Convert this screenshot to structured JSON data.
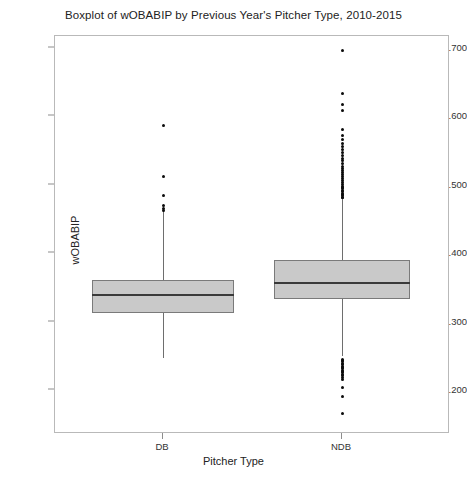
{
  "chart_data": {
    "type": "boxplot",
    "title": "Boxplot of wOBABIP by Previous Year's Pitcher Type, 2010-2015",
    "xlabel": "Pitcher Type",
    "ylabel": "wOBABIP",
    "categories": [
      "DB",
      "NDB"
    ],
    "ylim": [
      0.155,
      0.718
    ],
    "yticks": [
      0.7,
      0.6,
      0.5,
      0.4,
      0.3,
      0.2
    ],
    "ytick_labels": [
      ".700",
      ".600",
      ".500",
      ".400",
      ".300",
      ".200"
    ],
    "grid": false,
    "legend": "none",
    "box_fill_color": "#c9c9c9",
    "box_edge_color": "#7a7a7a",
    "median_color": "#3a3a3a",
    "outlier_color": "#0b0b0b",
    "boxes": [
      {
        "label": "DB",
        "whisker_low": 0.247,
        "q1": 0.313,
        "median": 0.339,
        "q3": 0.361,
        "whisker_high": 0.462,
        "outliers": [
          0.586,
          0.512,
          0.485,
          0.47,
          0.466,
          0.463
        ]
      },
      {
        "label": "NDB",
        "whisker_low": 0.25,
        "q1": 0.333,
        "median": 0.357,
        "q3": 0.39,
        "whisker_high": 0.479,
        "outliers": [
          0.697,
          0.634,
          0.618,
          0.608,
          0.581,
          0.572,
          0.566,
          0.561,
          0.556,
          0.551,
          0.547,
          0.543,
          0.539,
          0.535,
          0.531,
          0.527,
          0.524,
          0.521,
          0.518,
          0.515,
          0.512,
          0.509,
          0.506,
          0.503,
          0.5,
          0.498,
          0.496,
          0.494,
          0.492,
          0.49,
          0.488,
          0.486,
          0.484,
          0.482,
          0.481,
          0.245,
          0.243,
          0.241,
          0.239,
          0.237,
          0.235,
          0.233,
          0.231,
          0.229,
          0.227,
          0.225,
          0.223,
          0.221,
          0.219,
          0.215,
          0.204,
          0.191,
          0.166
        ]
      }
    ]
  }
}
